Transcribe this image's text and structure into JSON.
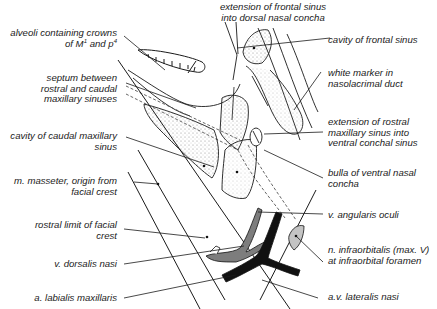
{
  "figure": {
    "type": "anatomical-illustration",
    "colors": {
      "line": "#1a1a1a",
      "stipple": "#9a9a9a",
      "vein_gray": "#7d7d7d",
      "artery_black": "#111111",
      "nerve_light": "#c4c4c4",
      "background": "#ffffff"
    }
  },
  "labels": {
    "top_center": {
      "line1": "extension of frontal sinus",
      "line2": "into dorsal nasal concha"
    },
    "left": [
      {
        "line1": "alveoli containing crowns",
        "line2_prefix": "of M",
        "sup1": "1",
        "line2_mid": " and p",
        "sup2": "4"
      },
      {
        "line1": "septum between",
        "line2": "rostral and caudal",
        "line3": "maxillary sinuses"
      },
      {
        "line1": "cavity of caudal maxillary",
        "line2": "sinus"
      },
      {
        "line1": "m. masseter, origin from",
        "line2": "facial crest"
      },
      {
        "line1": "rostral limit of facial",
        "line2": "crest"
      },
      {
        "line1": "v. dorsalis nasi"
      },
      {
        "line1": "a. labialis maxillaris"
      }
    ],
    "right": [
      {
        "line1": "cavity of frontal sinus"
      },
      {
        "line1": "white marker in",
        "line2": "nasolacrimal duct"
      },
      {
        "line1": "extension of rostral",
        "line2": "maxillary sinus into",
        "line3": "ventral conchal sinus"
      },
      {
        "line1": "bulla of ventral nasal",
        "line2": "concha"
      },
      {
        "line1": "v. angularis oculi"
      },
      {
        "line1": "n. infraorbitalis (max. V)",
        "line2": "at infraorbital foramen"
      },
      {
        "line1": "a.v. lateralis nasi"
      }
    ]
  }
}
